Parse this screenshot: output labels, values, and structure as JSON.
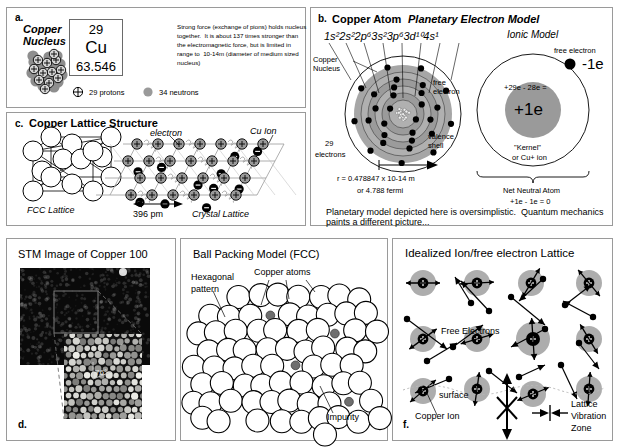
{
  "panel_a": {
    "letter": "a.",
    "heading_line1": "Copper",
    "heading_line2": "Nucleus",
    "element_box": {
      "atomic_number": "29",
      "symbol": "Cu",
      "atomic_mass": "63.546"
    },
    "body_text": [
      "Strong force (exchange of pions) holds nucleus",
      "together.  It is about 137 times stronger than",
      "the electromagnetic force, but is limited in",
      "range to  10-14m (diameter of medium sized",
      "nucleus)"
    ],
    "legend": [
      {
        "icon": "proton-plus-circle",
        "label": "29 protons"
      },
      {
        "icon": "neutron-gray-circle",
        "label": "34 neutrons"
      }
    ]
  },
  "panel_b": {
    "letter": "b.",
    "heading": "Copper Atom",
    "subtitle": "Planetary Electron Model",
    "electron_configuration": "1s²2s²2p⁶3s²3p⁶3d¹⁰4s¹",
    "labels": {
      "copper_nucleus_line1": "Copper",
      "copper_nucleus_line2": "Nucleus",
      "free_electron_line1": "free",
      "free_electron_line2": "electron",
      "valence_line1": "valence",
      "valence_line2": "shell",
      "electron_count_line1": "29",
      "electron_count_line2": "electrons"
    },
    "radius_line1": "r = 0.478847 x 10-14 m",
    "radius_line2": "or 4.788 fermi",
    "ionic_model": {
      "title": "Ionic Model",
      "free_electron_label": "free electron",
      "free_electron_charge": "-1e",
      "charge_math": "+29e - 28e =",
      "kernel_charge": "+1e",
      "kernel_line1": "\"Kernel\"",
      "kernel_line2": "or Cu+ ion",
      "net_line1": "Net Neutral Atom",
      "net_line2": "+1e - 1e = 0"
    },
    "footnote_line1": "Planetary model depicted here is oversimplistic.  Quantum mechanics",
    "footnote_line2": "paints a different picture..."
  },
  "panel_c": {
    "letter": "c.",
    "heading": "Copper Lattice Structure",
    "fcc_caption": "FCC Lattice",
    "electron_label": "electron",
    "cu_ion_label": "Cu Ion",
    "spacing_label": "396 pm",
    "crystal_caption": "Crystal Lattice"
  },
  "panel_d": {
    "letter": "d.",
    "heading": "STM Image of Copper 100",
    "inset_angle_label": "76°"
  },
  "panel_e": {
    "letter": "e.",
    "heading": "Ball Packing Model (FCC)",
    "labels": {
      "hexagonal_line1": "Hexagonal",
      "hexagonal_line2": "pattern",
      "copper_atoms": "Copper atoms",
      "impurity": "Impurity"
    }
  },
  "panel_f": {
    "letter": "f.",
    "heading": "Idealized Ion/free electron Lattice",
    "labels": {
      "free_electrons": "Free Electrons",
      "surface": "surface",
      "copper_ion": "Copper Ion",
      "lattice_line1": "Lattice",
      "lattice_line2": "Vibration",
      "lattice_line3": "Zone"
    }
  },
  "colors": {
    "panel_border": "#9a9a9a",
    "ion_gray": "#9a9a9a",
    "shell_gray": "#a6a6a6",
    "nucleus_gray": "#8e8e8e",
    "electron_black": "#000000",
    "background": "#ffffff"
  }
}
